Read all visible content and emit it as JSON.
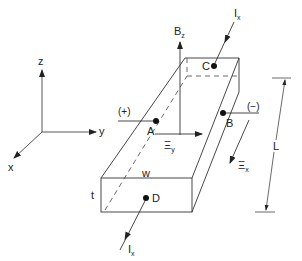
{
  "diagram": {
    "axes": {
      "x": "x",
      "y": "y",
      "z": "z"
    },
    "labels": {
      "field": {
        "main": "B",
        "sub": "z"
      },
      "current_top": {
        "main": "I",
        "sub": "x"
      },
      "current_bottom": {
        "main": "I",
        "sub": "x"
      },
      "efield_y": {
        "main": "Ξ",
        "sub": "y"
      },
      "efield_x": {
        "main": "Ξ",
        "sub": "x"
      },
      "length": "L",
      "width": "w",
      "thickness": "t",
      "plus_terminal": "(+)",
      "minus_terminal": "(−)"
    },
    "points": {
      "A": "A",
      "B": "B",
      "C": "C",
      "D": "D"
    },
    "colors": {
      "line": "#333333",
      "background": "#ffffff"
    }
  }
}
